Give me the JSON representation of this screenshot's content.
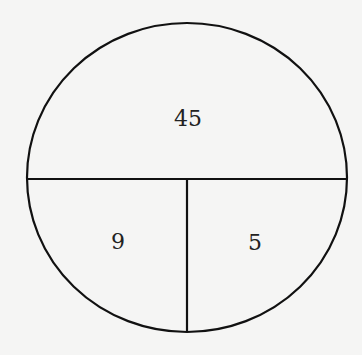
{
  "diagram": {
    "type": "divided-circle",
    "stroke_color": "#111111",
    "background": "#f5f5f4",
    "regions": [
      {
        "id": "top",
        "label": "45"
      },
      {
        "id": "bottom-left",
        "label": "9"
      },
      {
        "id": "bottom-right",
        "label": "5"
      }
    ]
  }
}
